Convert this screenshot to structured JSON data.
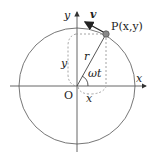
{
  "diagram": {
    "labels": {
      "y_axis": "y",
      "x_axis": "x",
      "origin": "O",
      "velocity": "v",
      "point": "P(x,y)",
      "radius": "r",
      "angle": "ωt",
      "y_projection": "y",
      "x_projection": "x"
    },
    "colors": {
      "line": "#555555",
      "circle": "#777777",
      "dashed": "#9a9a9a",
      "point_fill": "#888888",
      "arrow": "#222222"
    }
  }
}
